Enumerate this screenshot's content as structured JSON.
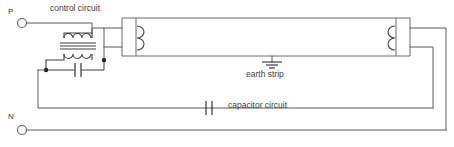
{
  "diagram": {
    "background_color": "#ffffff",
    "line_color": "#5a5a5a",
    "labels": {
      "control_circuit": "control circuit",
      "earth_strip": "earth strip",
      "capacitor_circuit": "capacitor circuit"
    },
    "terminals": [
      {
        "name": "phase",
        "label": "P"
      },
      {
        "name": "neutral",
        "label": "N"
      }
    ],
    "components": [
      {
        "name": "transformer-choke",
        "type": "iron-core-coil"
      },
      {
        "name": "control-capacitor",
        "type": "capacitor"
      },
      {
        "name": "power-factor-capacitor",
        "type": "capacitor"
      },
      {
        "name": "fluorescent-tube",
        "type": "lamp"
      },
      {
        "name": "left-electrode",
        "type": "filament"
      },
      {
        "name": "right-electrode",
        "type": "filament"
      },
      {
        "name": "earth-connection",
        "type": "ground"
      }
    ]
  }
}
